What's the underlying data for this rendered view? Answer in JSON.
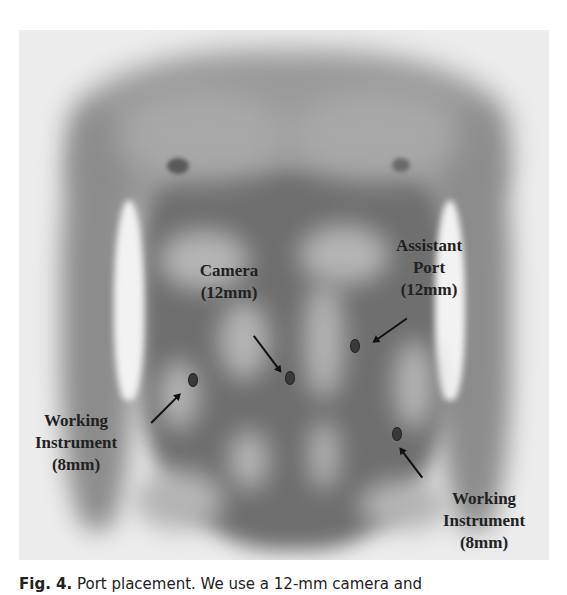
{
  "figure": {
    "type": "anatomical illustration",
    "labels": {
      "camera": {
        "line1": "Camera",
        "line2": "(12mm)"
      },
      "assistant_port": {
        "line1": "Assistant",
        "line2": "Port",
        "line3": "(12mm)"
      },
      "working_instrument_left": {
        "line1": "Working",
        "line2": "Instrument",
        "line3": "(8mm)"
      },
      "working_instrument_right": {
        "line1": "Working",
        "line2": "Instrument",
        "line3": "(8mm)"
      }
    },
    "ports": [
      {
        "name": "camera",
        "size": "12mm"
      },
      {
        "name": "assistant-port",
        "size": "12mm"
      },
      {
        "name": "working-instrument-left",
        "size": "8mm"
      },
      {
        "name": "working-instrument-right",
        "size": "8mm"
      }
    ]
  },
  "caption": {
    "label": "Fig. 4.",
    "text": " Port placement. We use a 12-mm camera and"
  },
  "colors": {
    "panel_bg": "#ececec",
    "text": "#222222"
  }
}
